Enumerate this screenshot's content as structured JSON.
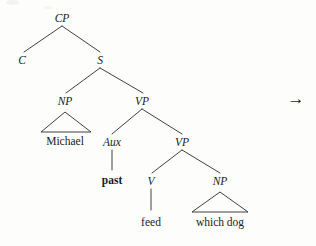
{
  "figure": {
    "kind": "syntax-tree",
    "background_color": "#fdfdfc",
    "ink_color": "#1b1b1b",
    "line_color": "#2a2a2a",
    "sentence": "Michael past feed which dog",
    "arrow_glyph": "→",
    "arrow_name": "rightwards-arrow"
  },
  "nodes": {
    "cp": {
      "label": "CP",
      "x": 62,
      "y": 22,
      "style": "italic"
    },
    "c": {
      "label": "C",
      "x": 22,
      "y": 64,
      "style": "italic"
    },
    "s": {
      "label": "S",
      "x": 100,
      "y": 64,
      "style": "italic"
    },
    "np_subj": {
      "label": "NP",
      "x": 65,
      "y": 105,
      "style": "italic"
    },
    "vp_outer": {
      "label": "VP",
      "x": 142,
      "y": 105,
      "style": "italic"
    },
    "aux": {
      "label": "Aux",
      "x": 112,
      "y": 146,
      "style": "italic"
    },
    "vp_inner": {
      "label": "VP",
      "x": 182,
      "y": 146,
      "style": "italic"
    },
    "v": {
      "label": "V",
      "x": 151,
      "y": 185,
      "style": "italic"
    },
    "np_obj": {
      "label": "NP",
      "x": 220,
      "y": 185,
      "style": "italic"
    }
  },
  "terminals": {
    "michael": {
      "label": "Michael",
      "x": 65,
      "y": 145,
      "weight": "normal"
    },
    "past": {
      "label": "past",
      "x": 112,
      "y": 184,
      "weight": "bold"
    },
    "feed": {
      "label": "feed",
      "x": 151,
      "y": 226,
      "weight": "normal"
    },
    "which_dog": {
      "label": "which dog",
      "x": 220,
      "y": 226,
      "weight": "normal"
    }
  },
  "branches": [
    {
      "name": "cp-to-c",
      "x1": 62,
      "y1": 26,
      "x2": 24,
      "y2": 52
    },
    {
      "name": "cp-to-s",
      "x1": 62,
      "y1": 26,
      "x2": 100,
      "y2": 52
    },
    {
      "name": "s-to-np",
      "x1": 100,
      "y1": 68,
      "x2": 66,
      "y2": 93
    },
    {
      "name": "s-to-vp",
      "x1": 100,
      "y1": 68,
      "x2": 143,
      "y2": 93
    },
    {
      "name": "vp-to-aux",
      "x1": 142,
      "y1": 109,
      "x2": 112,
      "y2": 134
    },
    {
      "name": "vp-to-vp",
      "x1": 142,
      "y1": 109,
      "x2": 182,
      "y2": 134
    },
    {
      "name": "vp-inner-to-v",
      "x1": 182,
      "y1": 150,
      "x2": 152,
      "y2": 173
    },
    {
      "name": "vp-inner-to-np",
      "x1": 182,
      "y1": 150,
      "x2": 220,
      "y2": 173
    }
  ],
  "stems": [
    {
      "name": "aux-to-past",
      "x1": 112,
      "y1": 150,
      "x2": 112,
      "y2": 170
    },
    {
      "name": "v-to-feed",
      "x1": 151,
      "y1": 189,
      "x2": 151,
      "y2": 210
    }
  ],
  "triangles": [
    {
      "name": "np-subject-triangle",
      "apex_x": 65,
      "apex_y": 112,
      "left_x": 41,
      "right_x": 91,
      "base_y": 132
    },
    {
      "name": "np-object-triangle",
      "apex_x": 220,
      "apex_y": 192,
      "left_x": 192,
      "right_x": 248,
      "base_y": 212
    }
  ],
  "arrow": {
    "x": 296,
    "y": 104
  }
}
